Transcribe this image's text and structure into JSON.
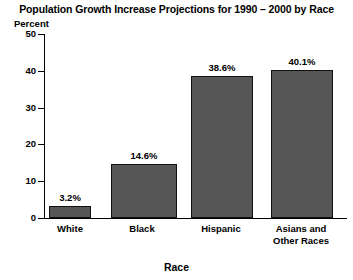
{
  "chart_data": {
    "type": "bar",
    "title": "Population Growth Increase Projections for 1990 – 2000 by Race",
    "xlabel": "Race",
    "ylabel": "Percent",
    "categories": [
      "White",
      "Black",
      "Hispanic",
      "Asians and Other Races"
    ],
    "category_lines": [
      [
        "White"
      ],
      [
        "Black"
      ],
      [
        "Hispanic"
      ],
      [
        "Asians and",
        "Other Races"
      ]
    ],
    "values": [
      3.2,
      14.6,
      38.6,
      40.1
    ],
    "data_labels": [
      "3.2%",
      "14.6%",
      "38.6%",
      "40.1%"
    ],
    "ylim": [
      0,
      50
    ],
    "yticks": [
      0,
      10,
      20,
      30,
      40,
      50
    ],
    "ytick_labels": [
      "0",
      "10",
      "20",
      "30",
      "40",
      "50"
    ],
    "grid": false,
    "legend": null,
    "bar_color": "#565656",
    "bar_border_color": "#111111",
    "axis_color": "#000000",
    "background_color": "#ffffff",
    "text_color": "#000000"
  }
}
